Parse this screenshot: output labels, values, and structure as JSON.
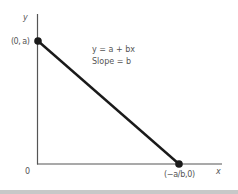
{
  "diagram": {
    "axis_labels": {
      "y": "y",
      "x": "x",
      "origin": "0"
    },
    "points": {
      "y_intercept": "(0, a)",
      "x_intercept": "(−a/b,0)"
    },
    "annotation": {
      "equation": "y = a + bx",
      "slope": "Slope = b"
    },
    "colors": {
      "axis": "#555555",
      "line": "#1a1a1a",
      "text": "#555555",
      "bottom_strip": "#c8c8c8"
    }
  }
}
